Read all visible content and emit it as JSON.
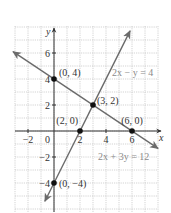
{
  "chart_data": {
    "type": "line",
    "title": "",
    "xlabel": "x",
    "ylabel": "y",
    "xlim": [
      -3,
      8
    ],
    "ylim": [
      -6,
      8
    ],
    "grid": true,
    "grid_step": 1,
    "x_ticks": [
      -2,
      2,
      4,
      6
    ],
    "x_tick_labels": [
      "−2",
      "2",
      "4",
      "6"
    ],
    "y_ticks": [
      6,
      4,
      2,
      -2,
      -4
    ],
    "y_tick_labels": [
      "6",
      "4",
      "2",
      "−2",
      "−4"
    ],
    "origin_label": "0",
    "series": [
      {
        "name": "2x − y = 4",
        "equation": "2x - y = 4",
        "slope": 2,
        "intercept": -4,
        "x_range": [
          -0.7,
          5.85
        ],
        "arrows": "both",
        "color": "#6b6b6b",
        "label": "2x − y = 4"
      },
      {
        "name": "2x + 3y = 12",
        "equation": "2x + 3y = 12",
        "slope": -0.6667,
        "intercept": 4,
        "x_range": [
          -3.15,
          8
        ],
        "arrows": "both",
        "color": "#6b6b6b",
        "label": "2x + 3y = 12"
      }
    ],
    "points": [
      {
        "x": 0,
        "y": 4,
        "label": "(0, 4)"
      },
      {
        "x": 3,
        "y": 2,
        "label": "(3, 2)"
      },
      {
        "x": 2,
        "y": 0,
        "label": "(2, 0)"
      },
      {
        "x": 6,
        "y": 0,
        "label": "(6, 0)"
      },
      {
        "x": 0,
        "y": -4,
        "label": "(0, −4)"
      }
    ],
    "annotations": [
      {
        "text": "2x − y = 4",
        "near": "upper-right line"
      },
      {
        "text": "2x + 3y = 12",
        "near": "lower-right line"
      }
    ]
  },
  "axes": {
    "x_label": "x",
    "y_label": "y"
  },
  "colors": {
    "grid": "#c8c8c8",
    "axis": "#333333",
    "line": "#6b6b6b",
    "point": "#111111",
    "text": "#333333",
    "equation_text": "#8a8a8a"
  }
}
